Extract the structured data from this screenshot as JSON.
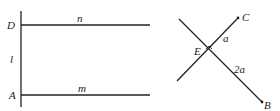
{
  "left_figure": {
    "vertical_line_label": "l",
    "top_line_label": "n",
    "bottom_line_label": "m",
    "top_point_label": "D",
    "bottom_point_label": "A"
  },
  "right_figure": {
    "intersection_label": "E",
    "upper_end_label": "C",
    "lower_end_label": "B",
    "segment_EC_label": "a",
    "segment_EB_label": "2a",
    "right_angle_marker": "right-angle-at-E"
  },
  "colors": {
    "stroke": "#222222",
    "background": "#ffffff"
  }
}
